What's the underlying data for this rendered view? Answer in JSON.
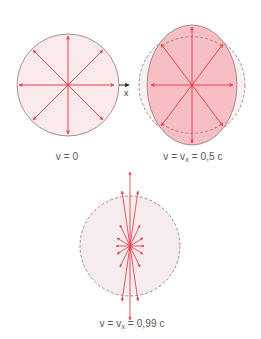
{
  "colors": {
    "arrow": "#e8414f",
    "fill_rest": "#fbeaeb",
    "fill_moving": "#f6b6bb",
    "fill_fast": "#f7eced",
    "outline": "#8a7a7c",
    "dashed": "#7a7a7a",
    "axis": "#222222"
  },
  "panels": [
    {
      "id": "rest",
      "label_v": "v",
      "label_rest": " = 0",
      "axis_label": "x"
    },
    {
      "id": "half_c",
      "label_v": "v = v",
      "label_sub": "x",
      "label_rest": " = 0,5 c"
    },
    {
      "id": "near_c",
      "label_v": "v = v",
      "label_sub": "x",
      "label_rest": " = 0,99 c"
    }
  ]
}
